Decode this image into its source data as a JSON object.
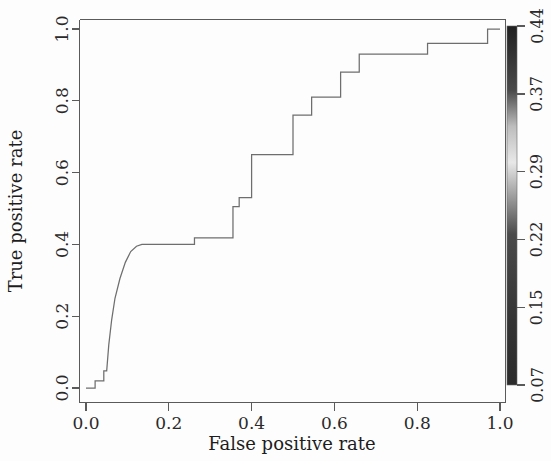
{
  "chart_data": {
    "type": "line",
    "title": "",
    "xlabel": "False positive rate",
    "ylabel": "True positive rate",
    "xlim": [
      0.0,
      1.0
    ],
    "ylim": [
      0.0,
      1.0
    ],
    "grid": false,
    "legend": "none",
    "x_ticks": [
      "0.0",
      "0.2",
      "0.4",
      "0.6",
      "0.8",
      "1.0"
    ],
    "x_tick_values": [
      0.0,
      0.2,
      0.4,
      0.6,
      0.8,
      1.0
    ],
    "y_ticks": [
      "0.0",
      "0.2",
      "0.4",
      "0.6",
      "0.8",
      "1.0"
    ],
    "y_tick_values": [
      0.0,
      0.2,
      0.4,
      0.6,
      0.8,
      1.0
    ],
    "series": [
      {
        "name": "ROC curve",
        "color": "#6e6e6e",
        "x": [
          0.0,
          0.022,
          0.022,
          0.043,
          0.043,
          0.05,
          0.055,
          0.062,
          0.07,
          0.082,
          0.095,
          0.108,
          0.122,
          0.135,
          0.262,
          0.262,
          0.29,
          0.29,
          0.355,
          0.355,
          0.37,
          0.37,
          0.4,
          0.4,
          0.455,
          0.455,
          0.5,
          0.5,
          0.545,
          0.545,
          0.615,
          0.615,
          0.66,
          0.66,
          0.825,
          0.825,
          0.97,
          0.97,
          1.0
        ],
        "y": [
          0.0,
          0.0,
          0.02,
          0.02,
          0.048,
          0.048,
          0.12,
          0.19,
          0.25,
          0.305,
          0.35,
          0.38,
          0.395,
          0.4,
          0.4,
          0.418,
          0.418,
          0.418,
          0.418,
          0.505,
          0.505,
          0.53,
          0.53,
          0.65,
          0.65,
          0.65,
          0.65,
          0.76,
          0.76,
          0.81,
          0.81,
          0.88,
          0.88,
          0.93,
          0.93,
          0.96,
          0.96,
          1.0,
          1.0
        ]
      }
    ],
    "colorbar": {
      "label": "",
      "orientation": "vertical",
      "position": "right",
      "ticks": [
        "0.07",
        "0.15",
        "0.22",
        "0.29",
        "0.37",
        "0.44"
      ],
      "tick_values": [
        0.07,
        0.15,
        0.22,
        0.29,
        0.37,
        0.44
      ],
      "min": 0.07,
      "max": 0.44,
      "colormap": "grayscale",
      "color_low": "#2b2b2b",
      "color_mid": "#e8e8e8",
      "color_high": "#202020"
    }
  }
}
